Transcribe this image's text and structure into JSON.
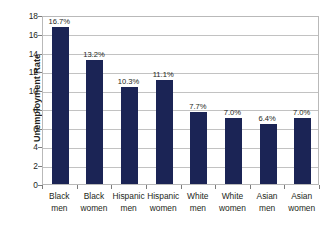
{
  "chart_data": {
    "type": "bar",
    "title": "",
    "xlabel": "",
    "ylabel": "Unemployment Rate",
    "ylim": [
      0,
      18
    ],
    "ytick_step": 2,
    "grid": true,
    "legend": false,
    "bar_color": "#1b2455",
    "gridline_color": "#c2c2c2",
    "plot_border_color": "#b9b9b9",
    "categories": [
      "Black men",
      "Black women",
      "Hispanic men",
      "Hispanic women",
      "White men",
      "White women",
      "Asian men",
      "Asian women"
    ],
    "category_lines": [
      [
        "Black",
        "men"
      ],
      [
        "Black",
        "women"
      ],
      [
        "Hispanic",
        "men"
      ],
      [
        "Hispanic",
        "women"
      ],
      [
        "White",
        "men"
      ],
      [
        "White",
        "women"
      ],
      [
        "Asian",
        "men"
      ],
      [
        "Asian",
        "women"
      ]
    ],
    "values": [
      16.7,
      13.2,
      10.3,
      11.1,
      7.7,
      7.0,
      6.4,
      7.0
    ],
    "data_labels": [
      "16.7%",
      "13.2%",
      "10.3%",
      "11.1%",
      "7.7%",
      "7.0%",
      "6.4%",
      "7.0%"
    ],
    "ytick_labels": [
      "18",
      "16",
      "14",
      "12",
      "10",
      "8",
      "6",
      "4",
      "2",
      "0"
    ],
    "ytick_values": [
      18,
      16,
      14,
      12,
      10,
      8,
      6,
      4,
      2,
      0
    ]
  }
}
